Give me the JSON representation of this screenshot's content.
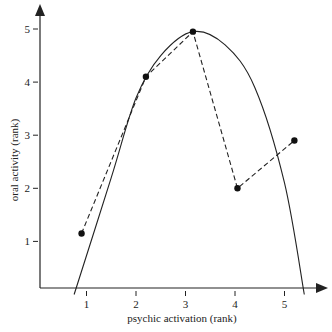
{
  "chart_data": {
    "type": "line",
    "title": "",
    "xlabel": "psychic activation (rank)",
    "ylabel": "oral activity (rank)",
    "x_ticks": [
      "1",
      "2",
      "3",
      "4",
      "5"
    ],
    "y_ticks": [
      "1",
      "2",
      "3",
      "4",
      "5"
    ],
    "xlim": [
      0,
      5.4
    ],
    "ylim": [
      0,
      5.3
    ],
    "grid": false,
    "legend": null,
    "series": [
      {
        "name": "observed ranks",
        "style": "dashed line with filled circle markers",
        "x": [
          0.9,
          2.2,
          3.15,
          4.05,
          5.2
        ],
        "y": [
          1.15,
          4.1,
          4.95,
          2.0,
          2.9
        ]
      },
      {
        "name": "inverted-U curve",
        "style": "solid smooth curve",
        "x": [
          0.75,
          1.5,
          2.0,
          2.5,
          3.15,
          3.8,
          4.4,
          5.0,
          5.4
        ],
        "y": [
          0.0,
          2.2,
          3.7,
          4.5,
          4.95,
          4.7,
          3.9,
          2.1,
          0.0
        ]
      }
    ],
    "colors": {
      "line": "#222222",
      "background": "#ffffff"
    }
  }
}
